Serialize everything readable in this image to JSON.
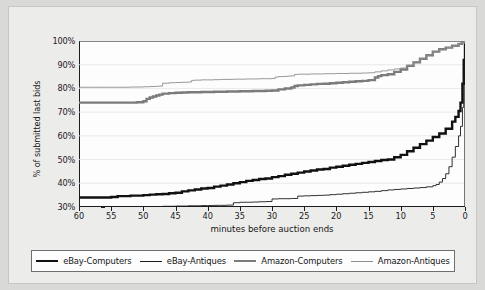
{
  "chart_data": {
    "type": "line",
    "title": "",
    "xlabel": "minutes before auction ends",
    "ylabel": "% of submitted last bids",
    "xlim": [
      60,
      0
    ],
    "ylim": [
      30,
      100
    ],
    "x_reversed": true,
    "grid": "horizontal",
    "legend_position": "bottom",
    "xticks": [
      60,
      55,
      50,
      45,
      40,
      35,
      30,
      25,
      20,
      15,
      10,
      5,
      0
    ],
    "xtick_labels": [
      "60",
      "55",
      "50",
      "45",
      "40",
      "35",
      "30",
      "25",
      "20",
      "15",
      "10",
      "5",
      "0"
    ],
    "yticks": [
      30,
      40,
      50,
      60,
      70,
      80,
      90,
      100
    ],
    "ytick_labels": [
      "30%",
      "40%",
      "50%",
      "60%",
      "70%",
      "80%",
      "90%",
      "100%"
    ],
    "series": [
      {
        "name": "eBay-Computers",
        "color": "#111111",
        "width": 2.4,
        "x": [
          60,
          58,
          56,
          55,
          54,
          52,
          50,
          49,
          48,
          47,
          46,
          45,
          44,
          43,
          42,
          41,
          40,
          39,
          38,
          37,
          36,
          35,
          34,
          33,
          32,
          31,
          30,
          29,
          28,
          27,
          26,
          25,
          24,
          23,
          22,
          21,
          20,
          19,
          18,
          17,
          16,
          15,
          14,
          13,
          12,
          11,
          10,
          9,
          8,
          7,
          6,
          5,
          4,
          3,
          2,
          1.5,
          1,
          0.7,
          0.4,
          0.2,
          0
        ],
        "y": [
          34.0,
          34.0,
          34.0,
          34.2,
          34.6,
          34.8,
          35.0,
          35.2,
          35.4,
          35.5,
          35.8,
          36.0,
          36.6,
          37.0,
          37.4,
          37.8,
          38.0,
          38.6,
          39.0,
          39.5,
          40.0,
          40.5,
          41.0,
          41.4,
          41.8,
          42.0,
          42.6,
          43.0,
          43.6,
          44.0,
          44.5,
          45.0,
          45.4,
          45.8,
          46.0,
          46.6,
          47.0,
          47.4,
          47.8,
          48.2,
          48.6,
          49.0,
          49.4,
          49.8,
          50.0,
          51.0,
          52.0,
          53.5,
          55.0,
          56.5,
          58.0,
          59.5,
          61.0,
          63.0,
          66.0,
          68.0,
          70.5,
          74.0,
          82.0,
          92.0,
          100.0
        ]
      },
      {
        "name": "eBay-Antiques",
        "color": "#1b1b1b",
        "width": 0.9,
        "x": [
          47,
          46,
          45,
          44,
          43,
          42,
          41,
          40,
          39,
          38,
          37,
          36,
          35,
          34,
          33,
          32,
          31,
          30,
          29,
          28,
          27,
          26,
          25,
          24,
          23,
          22,
          21,
          20,
          19,
          18,
          17,
          16,
          15,
          14,
          13,
          12,
          11,
          10,
          9,
          8,
          7,
          6,
          5,
          4.5,
          4,
          3.5,
          3,
          2.5,
          2,
          1.5,
          1,
          0.7,
          0.4,
          0.2,
          0
        ],
        "y": [
          30.3,
          30.3,
          30.4,
          30.4,
          30.5,
          30.5,
          30.6,
          30.6,
          30.7,
          30.7,
          30.8,
          31.8,
          32.0,
          32.0,
          32.1,
          32.2,
          32.3,
          33.4,
          33.5,
          33.5,
          33.6,
          34.6,
          34.7,
          34.8,
          34.9,
          35.0,
          35.2,
          35.4,
          35.6,
          35.8,
          36.0,
          36.2,
          36.4,
          36.6,
          36.9,
          37.2,
          37.4,
          37.6,
          37.8,
          38.0,
          38.2,
          38.5,
          39.0,
          39.5,
          40.5,
          42.0,
          44.0,
          47.0,
          51.0,
          55.5,
          60.0,
          64.0,
          72.0,
          86.0,
          100.0
        ]
      },
      {
        "name": "Amazon-Computers",
        "color": "#7b7b7b",
        "width": 2.4,
        "x": [
          60,
          58,
          56,
          54,
          53,
          52,
          51,
          50,
          49.5,
          49,
          48.5,
          48,
          47.5,
          47,
          46,
          45,
          44,
          43,
          42,
          41,
          40,
          39,
          38,
          37,
          36,
          35,
          34,
          33,
          32,
          31,
          30,
          29,
          28,
          27,
          26.5,
          26,
          25,
          24,
          23,
          22,
          21,
          20,
          19,
          18,
          17,
          16,
          15,
          14,
          13.5,
          13,
          12,
          11,
          10,
          9,
          8,
          7,
          6,
          5,
          4,
          3,
          2,
          1,
          0.5,
          0
        ],
        "y": [
          74.0,
          74.0,
          74.0,
          74.0,
          74.0,
          74.0,
          74.2,
          74.6,
          75.6,
          76.2,
          76.6,
          77.0,
          77.4,
          77.8,
          78.0,
          78.2,
          78.3,
          78.4,
          78.4,
          78.5,
          78.5,
          78.6,
          78.6,
          78.7,
          78.7,
          78.8,
          78.8,
          78.9,
          78.9,
          79.0,
          79.1,
          79.6,
          80.0,
          80.4,
          81.0,
          81.3,
          81.5,
          81.7,
          81.9,
          82.0,
          82.2,
          82.4,
          82.6,
          82.8,
          83.0,
          83.2,
          83.5,
          84.6,
          85.2,
          85.6,
          86.0,
          87.0,
          88.0,
          89.5,
          91.0,
          92.5,
          94.0,
          95.5,
          96.5,
          97.2,
          98.0,
          98.8,
          99.4,
          100.0
        ]
      },
      {
        "name": "Amazon-Antiques",
        "color": "#8d8d8d",
        "width": 0.9,
        "x": [
          60,
          58,
          56,
          54,
          52,
          50,
          49,
          48,
          47.5,
          47,
          46,
          45,
          44,
          43,
          42.5,
          42,
          41,
          40,
          39,
          38,
          37,
          36,
          35,
          34,
          33,
          32,
          31,
          30,
          29.5,
          29,
          28,
          27.5,
          27,
          26.5,
          26,
          25,
          24,
          23,
          22,
          21,
          20,
          19,
          18,
          17,
          16,
          15.5,
          15,
          14,
          13,
          12,
          11,
          10,
          9,
          8,
          7,
          6,
          5,
          4,
          3,
          2,
          1,
          0.5,
          0
        ],
        "y": [
          80.5,
          80.5,
          80.5,
          80.5,
          80.6,
          80.7,
          80.8,
          80.9,
          81.0,
          82.2,
          82.4,
          82.5,
          82.6,
          82.7,
          83.4,
          83.5,
          83.6,
          83.6,
          83.7,
          83.8,
          83.8,
          83.9,
          83.9,
          84.0,
          84.0,
          84.1,
          84.1,
          84.2,
          84.8,
          85.0,
          85.1,
          85.2,
          85.3,
          85.9,
          86.0,
          86.0,
          86.1,
          86.1,
          86.2,
          86.2,
          86.3,
          86.3,
          86.4,
          86.4,
          86.5,
          86.5,
          86.6,
          87.0,
          87.4,
          87.8,
          88.2,
          88.6,
          89.8,
          91.2,
          92.6,
          94.0,
          95.4,
          96.4,
          97.2,
          98.0,
          98.8,
          99.4,
          100.0
        ]
      }
    ]
  }
}
